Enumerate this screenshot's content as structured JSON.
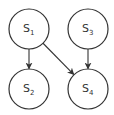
{
  "diagram": {
    "type": "directed-graph",
    "nodes": [
      {
        "id": "S1",
        "base": "S",
        "sub": "1",
        "cx": 29,
        "cy": 29,
        "r": 20
      },
      {
        "id": "S2",
        "base": "S",
        "sub": "2",
        "cx": 29,
        "cy": 89,
        "r": 20
      },
      {
        "id": "S3",
        "base": "S",
        "sub": "3",
        "cx": 88,
        "cy": 29,
        "r": 20
      },
      {
        "id": "S4",
        "base": "S",
        "sub": "4",
        "cx": 88,
        "cy": 89,
        "r": 20
      }
    ],
    "edges": [
      {
        "from": "S1",
        "to": "S2"
      },
      {
        "from": "S1",
        "to": "S4"
      },
      {
        "from": "S3",
        "to": "S4"
      }
    ],
    "colors": {
      "stroke": "#333333",
      "background": "#ffffff"
    }
  }
}
